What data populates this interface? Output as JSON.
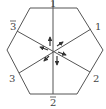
{
  "diagram": {
    "type": "hexagon-with-three-axes",
    "colors": {
      "stroke": "#444444",
      "background": "#ffffff",
      "label": "#444444"
    },
    "labels": {
      "top": "1",
      "top_right": "1",
      "bottom_right": "2",
      "bottom": "2",
      "bottom_left": "3",
      "top_left": "3"
    },
    "label_bars": {
      "top": false,
      "top_right": false,
      "bottom_right": false,
      "bottom": true,
      "bottom_left": false,
      "top_left": true
    },
    "arrows": [
      {
        "name": "arrow-up",
        "direction": "up"
      },
      {
        "name": "arrow-upper-right",
        "direction": "upper-right"
      },
      {
        "name": "arrow-right",
        "direction": "lower-right"
      },
      {
        "name": "arrow-down",
        "direction": "down"
      },
      {
        "name": "arrow-lower-left",
        "direction": "lower-left"
      },
      {
        "name": "arrow-left",
        "direction": "upper-left"
      }
    ]
  }
}
